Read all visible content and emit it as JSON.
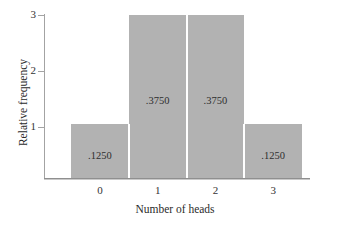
{
  "chart_data": {
    "type": "bar",
    "title": "",
    "subtitle": "",
    "xlabel": "Number of heads",
    "ylabel": "Relative frequency",
    "categories": [
      "0",
      "1",
      "2",
      "3"
    ],
    "values": [
      1,
      3,
      3,
      1
    ],
    "data_labels": [
      ".1250",
      ".3750",
      ".3750",
      ".1250"
    ],
    "ylim": [
      0,
      3
    ],
    "y_ticks": [
      "1",
      "2",
      "3"
    ],
    "y_tick_values": [
      1,
      2,
      3
    ],
    "xlim_categories": [
      "0",
      "1",
      "2",
      "3"
    ],
    "grid": false,
    "legend": null,
    "legend_position": "none",
    "bar_color": "#b2b2b2",
    "axis_color": "#a3a3a3",
    "baseline_color": "#8f8f8f",
    "separator_color": "#ffffff",
    "text_color": "#2b2b2b",
    "background": "#ffffff"
  }
}
